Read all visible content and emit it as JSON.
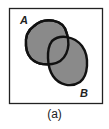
{
  "figure": {
    "caption": "(a)",
    "universe": {
      "shape": "rectangle"
    },
    "sets": [
      {
        "label": "A",
        "shaded": true
      },
      {
        "label": "B",
        "shaded": true
      }
    ],
    "colors": {
      "fill": "#8a8a8a",
      "stroke": "#111111",
      "background": "#ffffff"
    }
  }
}
